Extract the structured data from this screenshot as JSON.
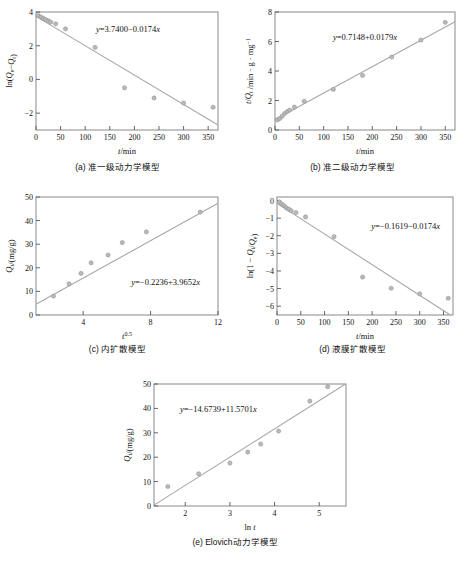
{
  "figure": {
    "marker_color": "#b9b9b9",
    "line_color": "#a8a8a8",
    "frame_color": "#888888"
  },
  "panels": [
    {
      "id": "a",
      "caption": "(a) 准一级动力学模型",
      "equation": "y=3.7400−0.0174x",
      "xlabel": "t/min",
      "ylabel": "ln(Qe−Qt)"
    },
    {
      "id": "b",
      "caption": "(b) 准二级动力学模型",
      "equation": "y=0.7148+0.0179x",
      "xlabel": "t/min",
      "ylabel": "t /Qt /min · g · mg⁻¹"
    },
    {
      "id": "c",
      "caption": "(c) 内扩散模型",
      "equation": "y=−0.2236+3.9652x",
      "xlabel": "t 0.5",
      "ylabel": "Qt /(mg/g)"
    },
    {
      "id": "d",
      "caption": "(d) 液膜扩散模型",
      "equation": "y=−0.1619−0.0174x",
      "xlabel": "t/min",
      "ylabel": "ln(1 − Qt /Qe)"
    },
    {
      "id": "e",
      "caption": "(e) Elovich动力学模型",
      "equation": "y=−14.6739+11.5701x",
      "xlabel": "ln t",
      "ylabel": "Qt /(mg/g)"
    }
  ],
  "chart_data": [
    {
      "type": "scatter",
      "panel": "a",
      "title": "(a) 准一级动力学模型",
      "xlabel": "t/min",
      "ylabel": "ln(Qe−Qt)",
      "xlim": [
        0,
        370
      ],
      "ylim": [
        -3,
        4
      ],
      "xticks": [
        0,
        50,
        100,
        150,
        200,
        250,
        300,
        350
      ],
      "yticks": [
        -2,
        0,
        2,
        4
      ],
      "grid": false,
      "x": [
        5,
        10,
        15,
        20,
        25,
        30,
        40,
        60,
        120,
        180,
        240,
        300,
        360
      ],
      "y": [
        3.78,
        3.7,
        3.62,
        3.55,
        3.48,
        3.4,
        3.3,
        3.0,
        1.9,
        -0.5,
        -1.1,
        -1.4,
        -1.65
      ],
      "fit": {
        "slope": -0.0174,
        "intercept": 3.74,
        "label": "y=3.7400−0.0174x"
      }
    },
    {
      "type": "scatter",
      "panel": "b",
      "title": "(b) 准二级动力学模型",
      "xlabel": "t/min",
      "ylabel": "t /Qt /min · g · mg⁻¹",
      "xlim": [
        0,
        370
      ],
      "ylim": [
        0,
        8
      ],
      "xticks": [
        0,
        50,
        100,
        150,
        200,
        250,
        300,
        350
      ],
      "yticks": [
        0,
        2,
        4,
        6,
        8
      ],
      "grid": false,
      "x": [
        5,
        10,
        15,
        20,
        25,
        30,
        40,
        60,
        120,
        180,
        240,
        300,
        350
      ],
      "y": [
        0.68,
        0.78,
        0.95,
        1.12,
        1.25,
        1.35,
        1.55,
        1.95,
        2.75,
        3.7,
        4.95,
        6.1,
        7.3
      ],
      "fit": {
        "slope": 0.0179,
        "intercept": 0.7148,
        "label": "y=0.7148+0.0179x"
      }
    },
    {
      "type": "scatter",
      "panel": "c",
      "title": "(c) 内扩散模型",
      "xlabel": "t 0.5",
      "ylabel": "Qt /(mg/g)",
      "xlim": [
        1.2,
        12
      ],
      "ylim": [
        0,
        50
      ],
      "xticks": [
        4,
        8,
        12
      ],
      "yticks": [
        0,
        10,
        20,
        30,
        40,
        50
      ],
      "grid": false,
      "x": [
        2.24,
        3.16,
        3.87,
        4.47,
        5.48,
        6.32,
        7.75,
        10.95
      ],
      "y": [
        8.0,
        13.2,
        17.6,
        22.1,
        25.4,
        30.7,
        35.2,
        43.6
      ],
      "fit": {
        "slope": 3.9652,
        "intercept": -0.2236,
        "label": "y=−0.2236+3.9652x"
      }
    },
    {
      "type": "scatter",
      "panel": "d",
      "title": "(d) 液膜扩散模型",
      "xlabel": "t/min",
      "ylabel": "ln(1 − Qt /Qe)",
      "xlim": [
        0,
        370
      ],
      "ylim": [
        -6.5,
        0.2
      ],
      "xticks": [
        0,
        50,
        100,
        150,
        200,
        250,
        300,
        350
      ],
      "yticks": [
        0,
        -1,
        -2,
        -3,
        -4,
        -5,
        -6
      ],
      "grid": false,
      "x": [
        5,
        10,
        15,
        20,
        25,
        30,
        40,
        60,
        120,
        180,
        240,
        300,
        360
      ],
      "y": [
        -0.08,
        -0.2,
        -0.3,
        -0.42,
        -0.5,
        -0.58,
        -0.68,
        -0.93,
        -2.05,
        -4.35,
        -4.98,
        -5.3,
        -5.55
      ],
      "fit": {
        "slope": -0.0174,
        "intercept": -0.1619,
        "label": "y=−0.1619−0.0174x"
      }
    },
    {
      "type": "scatter",
      "panel": "e",
      "title": "(e) Elovich动力学模型",
      "xlabel": "ln t",
      "ylabel": "Qt /(mg/g)",
      "xlim": [
        1.3,
        5.6
      ],
      "ylim": [
        0,
        50
      ],
      "xticks": [
        2,
        3,
        4,
        5
      ],
      "yticks": [
        0,
        10,
        20,
        30,
        40,
        50
      ],
      "grid": false,
      "x": [
        1.61,
        2.3,
        3.0,
        3.4,
        3.69,
        4.09,
        4.79,
        5.19
      ],
      "y": [
        8.0,
        13.2,
        17.6,
        22.1,
        25.4,
        30.7,
        43.0,
        48.9
      ],
      "fit": {
        "slope": 11.5701,
        "intercept": -14.6739,
        "label": "y=−14.6739+11.5701x"
      }
    }
  ]
}
